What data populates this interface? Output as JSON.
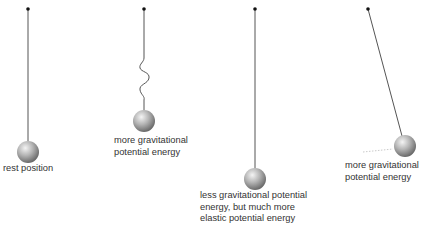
{
  "diagram": {
    "colors": {
      "string": "#555555",
      "pivot": "#111111",
      "ball_light": "#f2f2f2",
      "ball_mid": "#a8a8a8",
      "ball_dark": "#5a5a5a",
      "text": "#333333"
    },
    "pendulums": [
      {
        "id": "rest",
        "string_type": "straight",
        "label_lines": [
          "rest position"
        ]
      },
      {
        "id": "wavy",
        "string_type": "wavy",
        "label_lines": [
          "more gravitational",
          "potential energy"
        ]
      },
      {
        "id": "stretched",
        "string_type": "straight",
        "label_lines": [
          "less gravitational potential",
          "energy, but much more",
          "elastic potential energy"
        ]
      },
      {
        "id": "swung",
        "string_type": "angled",
        "label_lines": [
          "more gravitational",
          "potential energy"
        ]
      }
    ]
  }
}
